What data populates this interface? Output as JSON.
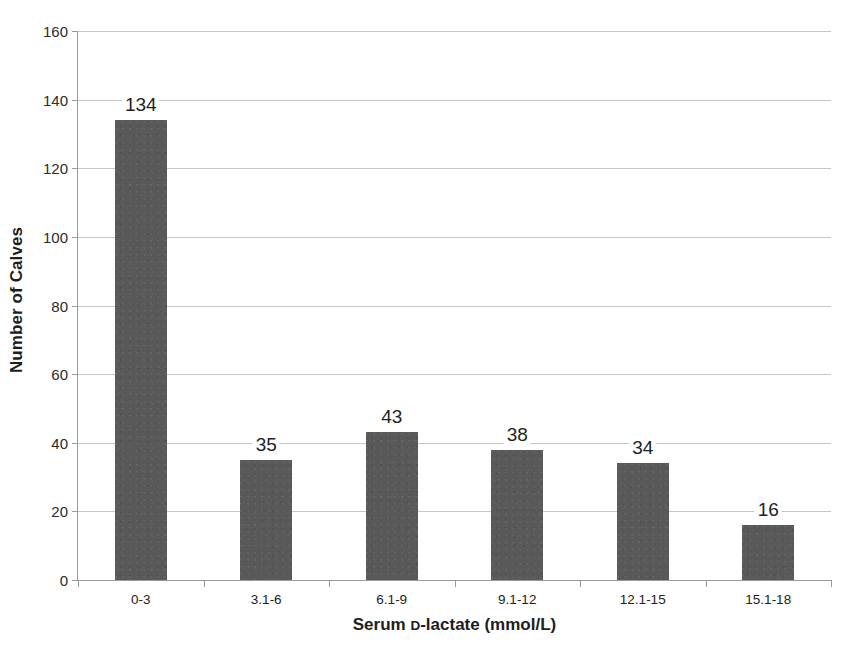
{
  "chart_data": {
    "type": "bar",
    "title": "",
    "subtitle": "",
    "xlabel": "Serum D-lactate (mmol/L)",
    "xlabel_parts": {
      "prefix": "Serum ",
      "smallcap": "D",
      "suffix": "-lactate (mmol/L)"
    },
    "ylabel": "Number of Calves",
    "categories": [
      "0-3",
      "3.1-6",
      "6.1-9",
      "9.1-12",
      "12.1-15",
      "15.1-18"
    ],
    "values": [
      134,
      35,
      43,
      38,
      34,
      16
    ],
    "value_labels": [
      "134",
      "35",
      "43",
      "38",
      "34",
      "16"
    ],
    "ylim": [
      0,
      160
    ],
    "ytick_step": 20,
    "yticks": [
      0,
      20,
      40,
      60,
      80,
      100,
      120,
      140,
      160
    ],
    "ytick_labels": [
      "0",
      "20",
      "40",
      "60",
      "80",
      "100",
      "120",
      "140",
      "160"
    ],
    "grid": true,
    "grid_axis": "y",
    "legend": false,
    "legend_position": "none",
    "bar_color": "#595959",
    "grid_color": "#c6c6c6",
    "axis_color": "#9a9a9a",
    "text_color": "#1d1d1d",
    "background_color": "#ffffff"
  }
}
